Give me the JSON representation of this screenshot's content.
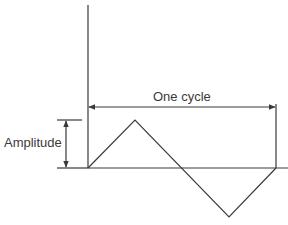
{
  "diagram": {
    "labels": {
      "cycle": "One cycle",
      "amplitude": "Amplitude"
    },
    "colors": {
      "line": "#3a3a3a",
      "background": "#ffffff"
    },
    "geometry": {
      "origin": [
        88,
        168
      ],
      "vertical_axis": {
        "x": 88,
        "y_top": 5,
        "y_bottom": 168
      },
      "baseline": {
        "y": 168,
        "x_start": 88,
        "x_end": 288
      },
      "wave_points": [
        [
          88,
          168
        ],
        [
          135,
          120
        ],
        [
          229,
          217
        ],
        [
          276,
          168
        ]
      ],
      "cycle_dimension": {
        "y": 107,
        "x_start": 88,
        "x_end": 276
      },
      "cycle_end_marker": {
        "x": 276,
        "y_top": 104,
        "y_bottom": 168
      },
      "amplitude_dimension": {
        "x": 66,
        "y_top": 120,
        "y_bottom": 168
      },
      "amplitude_extension_top": {
        "y": 120,
        "x_start": 57,
        "x_end": 82
      },
      "amplitude_extension_bottom": {
        "y": 168,
        "x_start": 57,
        "x_end": 88
      }
    }
  }
}
